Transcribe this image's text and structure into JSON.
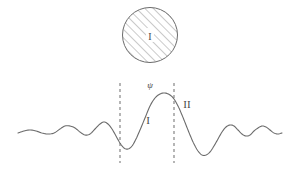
{
  "figure": {
    "background_color": "#ffffff",
    "stroke_color": "#6b6b6b",
    "hatch_color": "#8a8a8a",
    "dash_color": "#7a7a7a",
    "label_color": "#4a4a4a",
    "width": 300,
    "height": 173
  },
  "circle": {
    "label": "I",
    "center_x": 150,
    "center_y": 35,
    "radius": 28,
    "hatch_direction": "forward-slash",
    "hatch_spacing": 6
  },
  "wave": {
    "label_psi": "ψ",
    "label_region_inner": "I",
    "label_region_outer": "II",
    "baseline_y": 135,
    "peak_y": 92,
    "peak_x": 150
  },
  "boundaries": {
    "left_x": 120,
    "right_x": 174,
    "top_y": 83,
    "bottom_y": 163,
    "dash_pattern": "3 3"
  },
  "labels": {
    "psi": {
      "text": "ψ",
      "x": 150,
      "y": 88,
      "size": 9
    },
    "region_one": {
      "text": "I",
      "x": 148,
      "y": 124,
      "size": 11
    },
    "region_two": {
      "text": "II",
      "x": 187,
      "y": 108,
      "size": 11
    },
    "circle_one": {
      "text": "I",
      "x": 150,
      "y": 39,
      "size": 10
    }
  },
  "chart_data": {
    "type": "line",
    "xlabel": "",
    "ylabel": "",
    "grid": false,
    "legend": null,
    "xlim": [
      0,
      300
    ],
    "ylim": [
      173,
      0
    ],
    "series": [
      {
        "name": "psi",
        "comment": "Polyline of the wavefunction traced from the screenshot; y grows downward in pixel space.",
        "points": [
          [
            18,
            133
          ],
          [
            24,
            131
          ],
          [
            30,
            130
          ],
          [
            36,
            131
          ],
          [
            42,
            133
          ],
          [
            48,
            134
          ],
          [
            54,
            133
          ],
          [
            60,
            129
          ],
          [
            65,
            126
          ],
          [
            70,
            126
          ],
          [
            75,
            128
          ],
          [
            80,
            132
          ],
          [
            85,
            135
          ],
          [
            90,
            134
          ],
          [
            95,
            129
          ],
          [
            100,
            124
          ],
          [
            104,
            122
          ],
          [
            108,
            124
          ],
          [
            112,
            129
          ],
          [
            116,
            136
          ],
          [
            120,
            143
          ],
          [
            124,
            148
          ],
          [
            128,
            149
          ],
          [
            132,
            146
          ],
          [
            136,
            139
          ],
          [
            140,
            130
          ],
          [
            145,
            118
          ],
          [
            150,
            106
          ],
          [
            155,
            98
          ],
          [
            160,
            94
          ],
          [
            165,
            93
          ],
          [
            170,
            95
          ],
          [
            174,
            99
          ],
          [
            178,
            106
          ],
          [
            182,
            115
          ],
          [
            186,
            125
          ],
          [
            190,
            135
          ],
          [
            194,
            144
          ],
          [
            198,
            151
          ],
          [
            202,
            155
          ],
          [
            206,
            155
          ],
          [
            210,
            152
          ],
          [
            214,
            146
          ],
          [
            218,
            139
          ],
          [
            222,
            132
          ],
          [
            226,
            127
          ],
          [
            230,
            125
          ],
          [
            234,
            126
          ],
          [
            238,
            130
          ],
          [
            242,
            134
          ],
          [
            246,
            136
          ],
          [
            250,
            135
          ],
          [
            254,
            131
          ],
          [
            258,
            128
          ],
          [
            262,
            126
          ],
          [
            266,
            127
          ],
          [
            270,
            130
          ],
          [
            274,
            133
          ],
          [
            278,
            134
          ],
          [
            282,
            133
          ]
        ]
      }
    ],
    "annotations": [
      {
        "text": "ψ",
        "x": 150,
        "y": 88
      },
      {
        "text": "I",
        "x": 148,
        "y": 124
      },
      {
        "text": "II",
        "x": 187,
        "y": 108
      },
      {
        "text": "I",
        "x": 150,
        "y": 39
      }
    ],
    "vertical_markers": [
      {
        "name": "left-boundary",
        "x": 120,
        "style": "dashed"
      },
      {
        "name": "right-boundary",
        "x": 174,
        "style": "dashed"
      }
    ]
  }
}
